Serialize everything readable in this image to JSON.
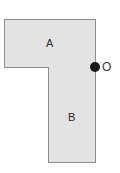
{
  "figure": {
    "type": "geometry-diagram",
    "background_color": "#ffffff",
    "shape_fill_color": "#e3e3e3",
    "shape_border_color": "#8c8c8c",
    "label_color": "#2b2b2b",
    "point_color": "#1a1a1a",
    "regions": [
      {
        "id": "rect-a",
        "label": "A",
        "shape": "rectangle",
        "orientation": "horizontal",
        "x": 4,
        "y": 19,
        "width": 92,
        "height": 49
      },
      {
        "id": "rect-b",
        "label": "B",
        "shape": "rectangle",
        "orientation": "vertical",
        "x": 48,
        "y": 67,
        "width": 48,
        "height": 96
      }
    ],
    "points": [
      {
        "id": "point-o",
        "label": "O",
        "x": 95,
        "y": 67,
        "marker": "filled-circle",
        "note": "located at the right end of the boundary shared by A and B"
      }
    ]
  }
}
